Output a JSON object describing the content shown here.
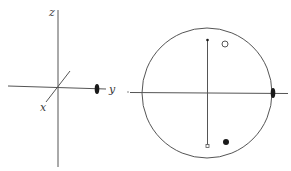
{
  "figure": {
    "left_panel": {
      "description": "3D coordinate axes with twofold symmetry element on y-axis",
      "axes": {
        "z": {
          "label": "z"
        },
        "y": {
          "label": "y"
        },
        "x": {
          "label": "x"
        }
      },
      "symmetry_element": "twofold-axis-lens-symbol"
    },
    "right_panel": {
      "description": "Stereographic projection with twofold axis",
      "primitive_circle": true,
      "points": [
        {
          "type": "open-circle",
          "position": "upper-right"
        },
        {
          "type": "filled-circle",
          "position": "lower-right"
        }
      ],
      "symmetry_element": "twofold-axis-lens-symbol"
    }
  },
  "colors": {
    "line": "#555555",
    "fill": "#1a1a1a",
    "background": "#ffffff"
  }
}
